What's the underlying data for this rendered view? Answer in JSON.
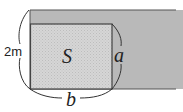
{
  "diagram": {
    "title": "",
    "shapes": {
      "outer_band": {
        "description": "long strip of width 2m",
        "fill": "#b8b8b8"
      },
      "inner_rect": {
        "description": "rectangle with area S",
        "fill": "#d4d4d4"
      }
    },
    "labels": {
      "width": "2m",
      "area": "S",
      "side_a": "a",
      "side_b": "b"
    },
    "colors": {
      "outline": "#444444",
      "outer_fill": "#b8b8b8",
      "inner_fill": "#d4d4d4"
    }
  }
}
